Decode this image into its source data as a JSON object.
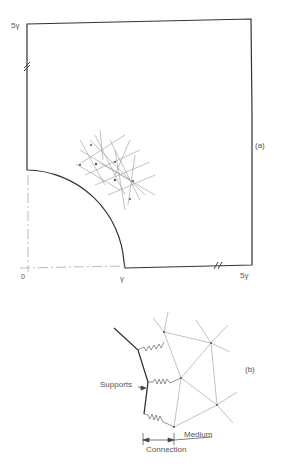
{
  "figure_a": {
    "label": "(a)",
    "top_left_label": "5γ",
    "origin_label": "0",
    "r_label": "γ",
    "bottom_right_label": "5γ"
  },
  "figure_b": {
    "label": "(b)",
    "supports_label": "Supports",
    "medium_label": "Medium",
    "connection_label": "Connection"
  },
  "colors": {
    "outline": "#333333",
    "mesh": "#999999",
    "text": "#555555"
  }
}
